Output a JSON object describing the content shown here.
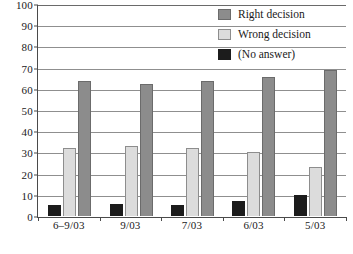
{
  "chart_data": {
    "type": "bar",
    "title": "",
    "xlabel": "",
    "ylabel": "",
    "ylim": [
      0,
      100
    ],
    "ytick_step": 10,
    "yticks": [
      100,
      90,
      80,
      70,
      60,
      50,
      40,
      30,
      20,
      10,
      0
    ],
    "grid": true,
    "legend_position": "top-right",
    "categories": [
      "6–9/03",
      "9/03",
      "7/03",
      "6/03",
      "5/03"
    ],
    "series": [
      {
        "name": "(No answer)",
        "color": "#1c1c1c",
        "values": [
          5,
          5.5,
          5,
          7,
          10
        ]
      },
      {
        "name": "Wrong decision",
        "color": "#dcdcdc",
        "values": [
          32,
          33,
          32,
          30,
          23
        ]
      },
      {
        "name": "Right decision",
        "color": "#8c8c8c",
        "values": [
          63.5,
          62,
          63.5,
          65.5,
          68.5
        ]
      }
    ]
  },
  "legend": {
    "items": [
      {
        "label": "Right decision",
        "swatch": "right"
      },
      {
        "label": "Wrong decision",
        "swatch": "wrong"
      },
      {
        "label": "(No answer)",
        "swatch": "noanswer"
      }
    ]
  }
}
